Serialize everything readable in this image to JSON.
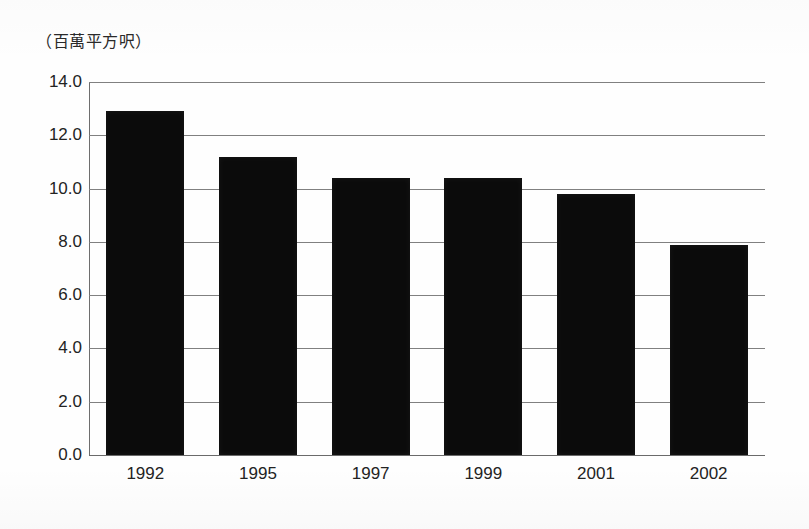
{
  "chart_data": {
    "type": "bar",
    "title": "",
    "subtitle": "",
    "unit_caption": "（百萬平方呎）",
    "xlabel": "",
    "ylabel": "",
    "categories": [
      "1992",
      "1995",
      "1997",
      "1999",
      "2001",
      "2002"
    ],
    "values": [
      12.9,
      11.2,
      10.4,
      10.4,
      9.8,
      7.9
    ],
    "series": [
      {
        "name": "",
        "values": [
          12.9,
          11.2,
          10.4,
          10.4,
          9.8,
          7.9
        ]
      }
    ],
    "ylim": [
      0.0,
      14.0
    ],
    "ytick_labels": [
      "14.0",
      "12.0",
      "10.0",
      "8.0",
      "6.0",
      "4.0",
      "2.0",
      "0.0"
    ],
    "ytick_values": [
      14.0,
      12.0,
      10.0,
      8.0,
      6.0,
      4.0,
      2.0,
      0.0
    ],
    "grid": true,
    "grid_axis": "y",
    "legend": false,
    "legend_position": "none",
    "bar_color": "#0b0b0b",
    "grid_color": "#808080",
    "background_color": "#ffffff",
    "text_color": "#232323"
  }
}
